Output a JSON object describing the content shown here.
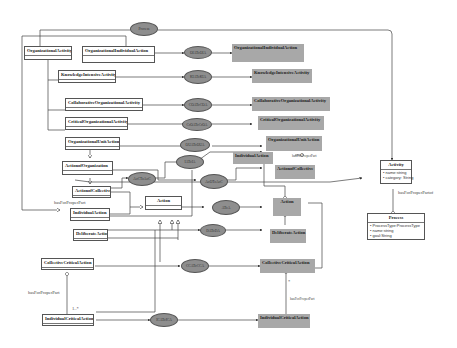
{
  "diagram": {
    "type": "UML class diagram",
    "classes": [
      {
        "id": "OrganizationalActivity",
        "label": "OrganizationalActivity"
      },
      {
        "id": "OrganizationalIndividualAction",
        "label": "OrganizationalIndividualAction"
      },
      {
        "id": "KnowledgeIntensiveActivity",
        "label": "KnowledgeIntensiveActivity"
      },
      {
        "id": "CollaborativeOrganizationalActivity",
        "label": "CollaborativeOrganizationalActivity"
      },
      {
        "id": "CriticalOrganizationalActivity",
        "label": "CriticalOrganizationalActivity"
      },
      {
        "id": "OrganizationalUnitAction",
        "label": "OrganizationalUnitAction"
      },
      {
        "id": "ActionofOrganization",
        "label": "ActionofOrganization"
      },
      {
        "id": "ActionofCollective",
        "label": "ActionofCollective"
      },
      {
        "id": "IndividualAction",
        "label": "IndividualAction"
      },
      {
        "id": "Action",
        "label": "Action"
      },
      {
        "id": "DeliberateAction",
        "label": "DeliberateAction"
      },
      {
        "id": "CollectiveCriticalAction",
        "label": "CollectiveCriticalAction"
      },
      {
        "id": "IndividualCriticalAction",
        "label": "IndividualCriticalAction"
      }
    ],
    "gray_classes": [
      {
        "id": "g_OrganizationalIndividualAction",
        "label": "OrganizationalIndividualAction"
      },
      {
        "id": "g_KnowledgeIntensiveActivity",
        "label": "KnowledgeIntensiveActivity"
      },
      {
        "id": "g_CollaborativeOrganizationalActivity",
        "label": "CollaborativeOrganizationalActivity"
      },
      {
        "id": "g_CriticalOrganizationalActivity",
        "label": "CriticalOrganizationalActivity"
      },
      {
        "id": "g_OrganizationalUnitAction",
        "label": "OrganizationalUnitAction"
      },
      {
        "id": "g_IndividualAction",
        "label": "IndividualAction"
      },
      {
        "id": "g_ActionofCollective",
        "label": "ActionofCollective"
      },
      {
        "id": "g_Action",
        "label": "Action"
      },
      {
        "id": "g_DeliberateAction",
        "label": "DeliberateAction"
      },
      {
        "id": "g_CollectiveCriticalAction",
        "label": "CollectiveCriticalAction"
      },
      {
        "id": "g_IndividualCriticalAction",
        "label": "IndividualCriticalAction"
      }
    ],
    "activity": {
      "label": "Activity",
      "attributes": [
        "• name:string",
        "• category: String"
      ]
    },
    "process": {
      "label": "Process",
      "attributes": [
        "• ProcessType:ProcessType",
        "• name:string",
        "• goal:String"
      ]
    },
    "ellipses": [
      {
        "id": "e_top",
        "label": "Process"
      },
      {
        "id": "e1",
        "label": "OIAToOIA"
      },
      {
        "id": "e2",
        "label": "KIAToKIA"
      },
      {
        "id": "e3",
        "label": "COAToCOA"
      },
      {
        "id": "e4",
        "label": "CrOAToCrOA"
      },
      {
        "id": "e5",
        "label": "OUAToOUA"
      },
      {
        "id": "e6",
        "label": "IAToIA"
      },
      {
        "id": "e7",
        "label": "AoCToAoC"
      },
      {
        "id": "e8",
        "label": "AoOToAoC"
      },
      {
        "id": "e9",
        "label": "AToA"
      },
      {
        "id": "e10",
        "label": "DAToDA"
      },
      {
        "id": "e11",
        "label": "CCAToCCA"
      },
      {
        "id": "e12",
        "label": "ICAToICA"
      }
    ],
    "edge_labels": {
      "hasForProperPart_left": "hasForProperPart",
      "hasForProperPart_activity": "hasForProperPartof",
      "hasForProperPart_ind": "hasForProperPart",
      "hasForProperPart_cca": "hasForProperPart",
      "hasForProperPart_gcca": "hasForProperPart",
      "mult_star": "*",
      "mult_one_star": "1..*"
    }
  }
}
